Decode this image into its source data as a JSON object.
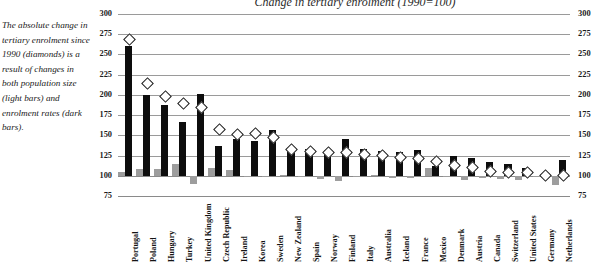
{
  "title": "Change in tertiary enrolment (1990=100)",
  "annotation": "The absolute change in tertiary enrolment since 1990 (diamonds) is a result of changes in both population size (light bars) and enrolment rates (dark bars).",
  "colors": {
    "dark_bar": "#0d0d0d",
    "light_bar": "#9d9d9d",
    "diamond_fill": "#ffffff",
    "diamond_stroke": "#1a1a1a",
    "gridline": "#9a9a9a"
  },
  "legend": {
    "diamonds": "diamonds",
    "light_bars": "light bars",
    "dark_bars": "dark bars"
  },
  "chart_data": {
    "type": "bar",
    "title": "Change in tertiary enrolment (1990=100)",
    "xlabel": "",
    "ylabel": "",
    "ylim": [
      75,
      300
    ],
    "yticks": [
      75,
      100,
      125,
      150,
      175,
      200,
      225,
      250,
      275,
      300
    ],
    "ytick_labels": [
      "75",
      "100",
      "125",
      "150",
      "175",
      "200",
      "225",
      "250",
      "275",
      "300"
    ],
    "grid": true,
    "baseline": 100,
    "dual_axis": true,
    "legend_position": "none",
    "categories": [
      "Portugal",
      "Poland",
      "Hungary",
      "Turkey",
      "United Kingdom",
      "Czech Republic",
      "Ireland",
      "Korea",
      "Sweden",
      "New Zealand",
      "Spain",
      "Norway",
      "Finland",
      "Italy",
      "Australia",
      "Iceland",
      "France",
      "Mexico",
      "Denmark",
      "Austria",
      "Canada",
      "Switzerland",
      "United States",
      "Germany",
      "Netherlands"
    ],
    "series": [
      {
        "name": "Enrolment rates (dark bars)",
        "marker": "dark-bar",
        "values": [
          260,
          200,
          188,
          166,
          201,
          137,
          145,
          143,
          157,
          134,
          133,
          132,
          146,
          133,
          131,
          130,
          132,
          112,
          125,
          122,
          117,
          114,
          110,
          100,
          119
        ]
      },
      {
        "name": "Population size (light bars)",
        "marker": "light-bar",
        "values": [
          105,
          108,
          108,
          114,
          90,
          110,
          107,
          99,
          98,
          101,
          99,
          96,
          93,
          99,
          101,
          97,
          97,
          110,
          98,
          95,
          97,
          96,
          95,
          100,
          88
        ]
      },
      {
        "name": "Total change in tertiary enrolment (diamonds)",
        "marker": "diamond",
        "values": [
          270,
          215,
          199,
          190,
          186,
          158,
          152,
          153,
          148,
          134,
          131,
          130,
          130,
          128,
          126,
          124,
          122,
          119,
          114,
          112,
          107,
          105,
          105,
          102,
          101
        ]
      }
    ]
  }
}
